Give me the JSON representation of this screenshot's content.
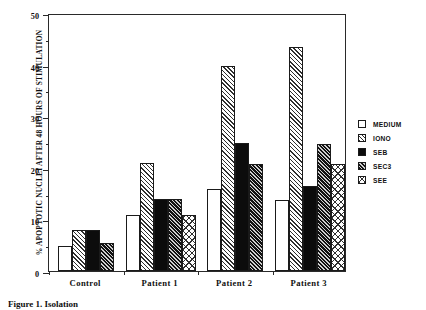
{
  "chart_data": {
    "type": "bar",
    "title": "",
    "xlabel": "",
    "ylabel": "% APOPTOTIC NUCLEI AFTER 48 HOURS OF STIMULATION",
    "ylim": [
      0,
      50
    ],
    "ytick_labels": [
      "0",
      "10",
      "20",
      "30",
      "40",
      "50"
    ],
    "ytick_values": [
      0,
      10,
      20,
      30,
      40,
      50
    ],
    "yminor_values": [
      5,
      15,
      25,
      35,
      45
    ],
    "grid": false,
    "legend_position": "right",
    "categories": [
      "Control",
      "Patient 1",
      "Patient 2",
      "Patient 3"
    ],
    "series": [
      {
        "name": "MEDIUM",
        "pattern": "plain-white",
        "values": [
          4.9,
          10.8,
          15.8,
          13.8
        ]
      },
      {
        "name": "IONO",
        "pattern": "diagonal-hatch",
        "values": [
          8.0,
          20.9,
          39.7,
          43.4
        ]
      },
      {
        "name": "SEB",
        "pattern": "solid-black",
        "values": [
          8.0,
          14.0,
          24.8,
          16.5
        ]
      },
      {
        "name": "SEC3",
        "pattern": "dense-diagonal-hatch",
        "values": [
          5.5,
          14.0,
          20.8,
          24.7
        ]
      },
      {
        "name": "SEE",
        "pattern": "cross-hatch",
        "values": [
          null,
          10.8,
          null,
          20.8
        ]
      }
    ]
  },
  "legend": {
    "items": [
      {
        "label": "MEDIUM",
        "pattern": "plain-white"
      },
      {
        "label": "IONO",
        "pattern": "diagonal-hatch"
      },
      {
        "label": "SEB",
        "pattern": "solid-black"
      },
      {
        "label": "SEC3",
        "pattern": "dense-diagonal-hatch"
      },
      {
        "label": "SEE",
        "pattern": "cross-hatch"
      }
    ]
  },
  "caption": {
    "text": "Figure 1. Isolation"
  }
}
